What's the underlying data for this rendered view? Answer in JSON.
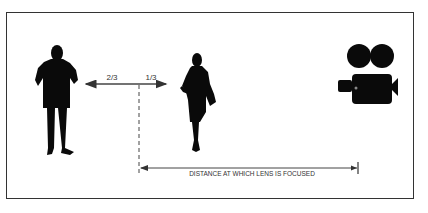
{
  "diagram": {
    "title": "",
    "subjects": [
      {
        "name": "man",
        "role": "near-subject"
      },
      {
        "name": "woman",
        "role": "far-subject"
      },
      {
        "name": "movie-camera",
        "role": "camera"
      }
    ],
    "depth_of_field": {
      "near_fraction_label": "2/3",
      "far_fraction_label": "1/3"
    },
    "focus_distance_label": "DISTANCE AT WHICH LENS IS FOCUSED",
    "colors": {
      "silhouette": "#0a0a0a",
      "line": "#333333",
      "background": "#ffffff"
    }
  }
}
